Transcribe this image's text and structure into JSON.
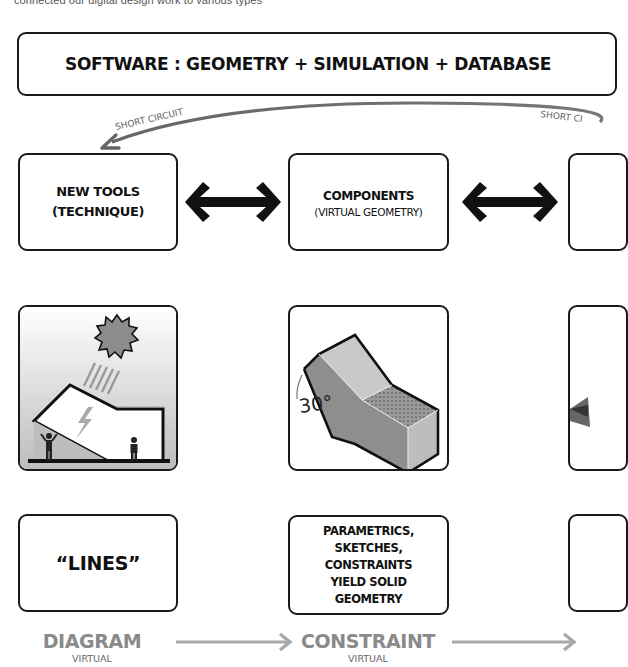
{
  "intro_text": "connected our digital design work to various types",
  "banner": {
    "title": "SOFTWARE : GEOMETRY + SIMULATION + DATABASE"
  },
  "short_circuit": {
    "left_label": "SHORT CIRCUIT",
    "right_label": "SHORT CI"
  },
  "row1": [
    {
      "title": "NEW TOOLS",
      "subtitle": "(TECHNIQUE)"
    },
    {
      "title": "COMPONENTS",
      "subtitle": "(VIRTUAL GEOMETRY)"
    }
  ],
  "row2": [
    {
      "icon": "solar-building-icon",
      "description": "sun rays on angled building with occupants"
    },
    {
      "icon": "solid-geometry-icon",
      "angle_label": "30°"
    }
  ],
  "row3": [
    {
      "text": "“LINES”"
    },
    {
      "lines": [
        "PARAMETRICS,",
        "SKETCHES,",
        "CONSTRAINTS",
        "YIELD SOLID",
        "GEOMETRY"
      ]
    }
  ],
  "stages": [
    {
      "label": "DIAGRAM",
      "sub": "VIRTUAL"
    },
    {
      "label": "CONSTRAINT",
      "sub": "VIRTUAL"
    }
  ],
  "colors": {
    "stroke": "#1a1a1a",
    "stage_gray": "#8a8a8a",
    "arrow_gray": "#a8a8a8",
    "curve_gray": "#6f6f6f"
  }
}
